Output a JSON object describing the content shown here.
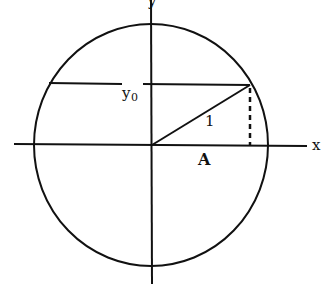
{
  "diagram": {
    "colors": {
      "stroke": "#111111",
      "background": "#ffffff"
    },
    "labels": {
      "x_axis": "x",
      "y_axis": "y",
      "y0": "y",
      "y0_subscript": "0",
      "radius": "1",
      "projection": "A"
    },
    "geometry": {
      "center": [
        151,
        145
      ],
      "radius_x": 117,
      "radius_y": 121,
      "chord_y": 84,
      "point": [
        250,
        84
      ]
    }
  }
}
